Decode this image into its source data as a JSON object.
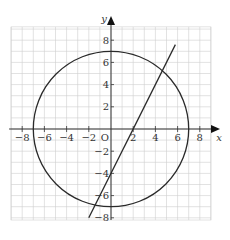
{
  "chart_data": {
    "type": "line",
    "title": "",
    "xlabel": "x",
    "ylabel": "y",
    "origin_label": "O",
    "xlim": [
      -9,
      9
    ],
    "ylim": [
      -8.2,
      9.2
    ],
    "grid": true,
    "x_ticks": [
      -8,
      -6,
      -4,
      -2,
      2,
      4,
      6,
      8
    ],
    "y_ticks": [
      -8,
      -6,
      -4,
      -2,
      2,
      4,
      6,
      8
    ],
    "x_tick_labels": [
      "−8",
      "−6",
      "−4",
      "−2",
      "2",
      "4",
      "6",
      "8"
    ],
    "y_tick_labels": [
      "−8",
      "−6",
      "−4",
      "−2",
      "2",
      "4",
      "6",
      "8"
    ],
    "series": [
      {
        "name": "circle",
        "equation": "x^2 + y^2 = 49",
        "center": [
          0,
          0
        ],
        "radius": 7
      },
      {
        "name": "line",
        "equation": "y = 2x - 4",
        "x": [
          -2,
          5.8
        ],
        "y": [
          -8,
          7.6
        ]
      }
    ],
    "colors": {
      "curve": "#2a2a2a",
      "axis": "#333333",
      "grid": "#cfcfcf"
    }
  }
}
